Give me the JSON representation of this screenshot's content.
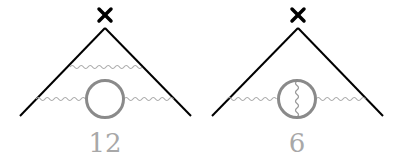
{
  "diagrams": [
    {
      "id": "left",
      "label": "12",
      "label_pos": {
        "x": 105,
        "y": 130
      },
      "vertex_marker": "cross",
      "description": "Vertex with two photon lines: one upper rung and one lower line with a fermion loop insertion"
    },
    {
      "id": "right",
      "label": "6",
      "label_pos": {
        "x": 297,
        "y": 130
      },
      "vertex_marker": "cross",
      "description": "Vertex with one photon line having a fermion loop with internal photon exchange"
    }
  ],
  "colors": {
    "line": "#000000",
    "photon": "#aaaaaa",
    "loop": "#888888",
    "label": "#a8a8a8"
  }
}
